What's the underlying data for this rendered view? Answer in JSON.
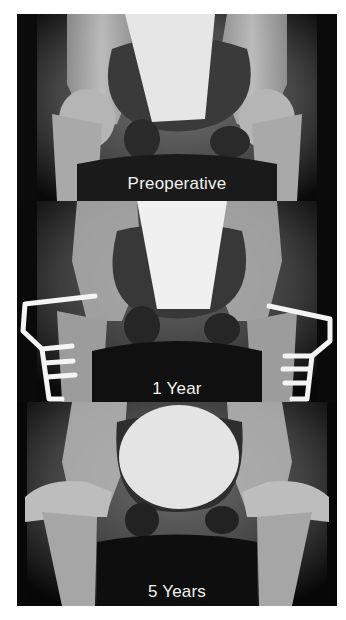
{
  "figure": {
    "panels": [
      {
        "id": "preoperative",
        "label": "Preoperative"
      },
      {
        "id": "one-year",
        "label": "1 Year"
      },
      {
        "id": "five-years",
        "label": "5 Years"
      }
    ]
  },
  "colors": {
    "background": "#ffffff",
    "xray_dark": "#050505",
    "bone": "#c8c8c8",
    "hardware": "#f4f4f4",
    "label_text": "#f2f2f2"
  }
}
